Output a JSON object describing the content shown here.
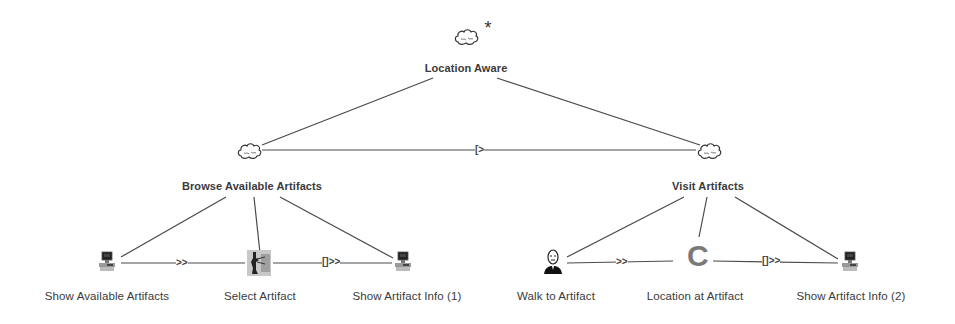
{
  "diagram": {
    "type": "task-model-tree",
    "root": {
      "label": "Location Aware",
      "icon": "abstract-task-cloud-icon",
      "marker": "*"
    },
    "level1": [
      {
        "label": "Browse Available Artifacts",
        "icon": "abstract-task-cloud-icon"
      },
      {
        "label": "Visit Artifacts",
        "icon": "abstract-task-cloud-icon"
      }
    ],
    "level1_operator": "[>",
    "leaves": [
      {
        "label": "Show Available Artifacts",
        "icon": "computer-icon",
        "parent": "Browse Available Artifacts"
      },
      {
        "label": "Select Artifact",
        "icon": "interaction-icon",
        "parent": "Browse Available Artifacts"
      },
      {
        "label": "Show Artifact Info (1)",
        "icon": "computer-icon",
        "parent": "Browse Available Artifacts"
      },
      {
        "label": "Walk to Artifact",
        "icon": "user-icon",
        "parent": "Visit Artifacts"
      },
      {
        "label": "Location at Artifact",
        "icon": "context-c-icon",
        "parent": "Visit Artifacts"
      },
      {
        "label": "Show Artifact Info (2)",
        "icon": "computer-icon",
        "parent": "Visit Artifacts"
      }
    ],
    "operators": {
      "browse_1": ">>",
      "browse_2": "[]>>",
      "visit_1": ">>",
      "visit_2": "[]>>"
    },
    "colors": {
      "line": "#4a4a4a",
      "text": "#3a3a3a",
      "context_c": "#7a7a7a"
    }
  }
}
